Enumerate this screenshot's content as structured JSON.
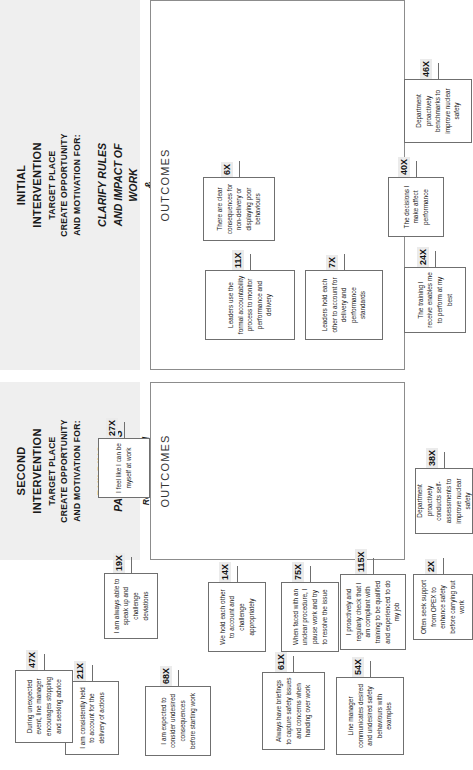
{
  "diagram": {
    "orientation": "rotated-90-ccw",
    "sections": [
      {
        "id": "initial-intervention",
        "header": {
          "line1": "INITIAL",
          "line2": "INTERVENTION",
          "line3": "TARGET PLACE",
          "line4": "CREATE OPPORTUNITY",
          "line5": "AND MOTIVATION FOR:",
          "emphasis": "CLARIFY RULES AND IMPACT OF WORK & EMPOWER TEAMS",
          "emphasis_lines": [
            "CLARIFY RULES",
            "AND IMPACT OF",
            "WORK",
            "&",
            "EMPOWER",
            "TEAMS"
          ],
          "subtext": "Conformity, People Focus, Outer Focus, Team Focus and Empowerment",
          "subtext_lines": [
            "Conformity, People",
            "Focus, Outer Focus,",
            "Team Focus and",
            "Empowerment"
          ]
        },
        "outcomes_label": "OUTCOMES",
        "outcomes": [
          {
            "text": "Leaders use the formal accountability process to monitor performance and delivery",
            "tag": "11X"
          },
          {
            "text": "Leaders hold each other to account for delivery and performance standards",
            "tag": "7X"
          },
          {
            "text": "There are clear consequences for non-delivery or displaying poor behaviours",
            "tag": "6X"
          },
          {
            "text": "The training I receive enables me to perform at my best",
            "tag": "24X"
          },
          {
            "text": "The decisions I make affect performance",
            "tag": "40X"
          },
          {
            "text": "Department proactively benchmarks to improve nuclear safety",
            "tag": "46X"
          }
        ]
      },
      {
        "id": "second-intervention",
        "header": {
          "line1": "SECOND",
          "line2": "INTERVENTION",
          "line3": "TARGET PLACE",
          "line4": "CREATE OPPORTUNITY",
          "line5": "AND MOTIVATION FOR:",
          "emphasis": "BUILDING PARTNERSHIPS",
          "emphasis_lines": [
            "BUILDING",
            "PARTNERSHIPS"
          ],
          "subtext": "Relationship and Collective",
          "subtext_lines": [
            "Relationship and",
            "Collective"
          ]
        },
        "outcomes_label": "OUTCOMES",
        "outcomes": [
          {
            "text": "I am consistently held to account for the delivery of actions",
            "tag": "21X"
          },
          {
            "text": "We hold each other to account and challenge appropriately",
            "tag": "14X"
          },
          {
            "text": "I am expected to consider undesired consequences before starting work",
            "tag": "68X"
          },
          {
            "text": "When faced with an unclear procedure, I pause work and try to resolve the issue",
            "tag": "75X"
          },
          {
            "text": "Always have briefings to capture safety issues and concerns when handing over work",
            "tag": "61X"
          },
          {
            "text": "Line manager communicates desired and undesired safety behaviours with examples",
            "tag": "54X"
          },
          {
            "text": "I proactively and regularly check that I am compliant with training to be qualified and experienced to do my job",
            "tag": "115X"
          },
          {
            "text": "During unexpected event, line manager encourages stopping and seeking advice",
            "tag": "47X"
          },
          {
            "text": "I am always able to speak up and challenge deviations",
            "tag": "19X"
          },
          {
            "text": "Often seek support from OPEX to enhance safety before carrying out work",
            "tag": "2X"
          },
          {
            "text": "I feel like I can be myself at work",
            "tag": "27X"
          },
          {
            "text": "Department proactively conducts self-assessments to improve nuclear safety",
            "tag": "38X"
          }
        ]
      }
    ],
    "colors": {
      "header_band": "#efefef",
      "box_border": "#6f6f6f",
      "tag_background": "#ebebeb",
      "page_background": "#ffffff"
    }
  }
}
